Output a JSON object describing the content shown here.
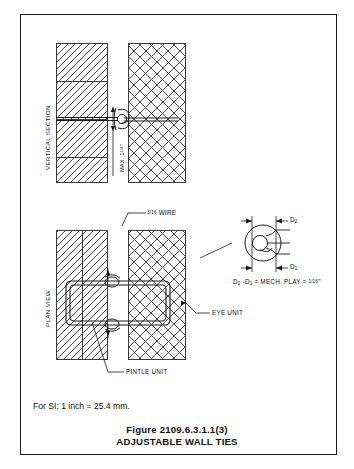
{
  "figure": {
    "number": "Figure 2109.6.3.1.1(3)",
    "title": "ADJUSTABLE WALL TIES",
    "si_note": "For SI:  1 inch = 25.4 mm."
  },
  "views": {
    "vertical_section_label": "VERTICAL SECTION",
    "plan_view_label": "PLAN VIEW"
  },
  "annotations": {
    "max_gap": "MAX. 1",
    "max_gap_fraction": "1/4",
    "max_gap_unit": "\"",
    "wire_gauge": "3/16",
    "wire_label": "WIRE",
    "eye_unit": "EYE UNIT",
    "pintle_unit": "PINTLE UNIT",
    "d2": "D",
    "d2_sub": "2",
    "d1": "D",
    "d1_sub": "1",
    "mech_play_prefix": "D",
    "mech_play_sub2": "2",
    "mech_play_mid": " -D",
    "mech_play_sub1": "1",
    "mech_play_eq": " = MECH. PLAY = ",
    "mech_play_value": "1/16",
    "mech_play_unit": "\""
  },
  "colors": {
    "ink": "#1a1a1a",
    "hatch": "#4a4a4a",
    "paper": "#ffffff"
  }
}
